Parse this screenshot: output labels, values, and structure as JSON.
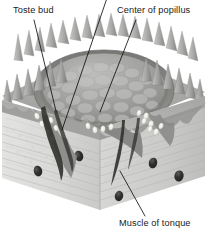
{
  "figure": {
    "width": 208,
    "height": 233,
    "background_color": "#ffffff",
    "style": "grayscale anatomical illustration"
  },
  "labels": [
    {
      "id": "taste-bud",
      "text": "Toste bud",
      "position": {
        "x": 13,
        "y": 6
      },
      "leader_line": {
        "x1": 34,
        "y1": 20,
        "x2": 56,
        "y2": 111
      }
    },
    {
      "id": "center-of-papilla",
      "text": "Center of popillus",
      "position": {
        "x": 117,
        "y": 6
      },
      "leader_line": {
        "x1": 136,
        "y1": 20,
        "x2": 100,
        "y2": 112
      }
    },
    {
      "id": "muscle-of-tongue",
      "text": "Muscle of tonque",
      "position": {
        "x": 119,
        "y": 219
      },
      "leader_line": {
        "x1": 145,
        "y1": 216,
        "x2": 120,
        "y2": 171
      }
    }
  ],
  "unlabeled_leader_line": {
    "id": "trench-pointer",
    "x1": 107,
    "y1": -2,
    "x2": 62,
    "y2": 130
  },
  "colors": {
    "background": "#ffffff",
    "face_left": "#d8d8d6",
    "face_right": "#cfd0cf",
    "face_top_light": "#c6c7c5",
    "epithelium": "#a9aaa8",
    "trench_wall": "#8e8f8d",
    "papilla_dome": "#9b9c9a",
    "spike_light": "#b8b9b7",
    "spike_dark": "#7d7e7c",
    "vessel_dark": "#2d2e2c",
    "taste_bud_light": "#f2f2ef",
    "leader_line": "#111111",
    "label_text": "#1a1a1a"
  },
  "structures": {
    "filiform_papillae": {
      "name": "filiform papillae spikes",
      "count_front_left": 9,
      "count_front_right": 9,
      "count_back_rim": 18
    },
    "circumvallate_papilla": {
      "name": "central circumvallate papilla dome",
      "center": {
        "x": 104,
        "y": 86
      },
      "radius_x": 62,
      "radius_y": 34,
      "bump_rows": 5
    },
    "trench": {
      "name": "circular trench surrounding papilla",
      "description": "groove separating papilla from surrounding epithelium"
    },
    "taste_buds": {
      "name": "taste buds in trench walls",
      "count": 18,
      "description": "small light ovals embedded along both trench walls"
    },
    "nerve_vessel_bundles": {
      "name": "nerve and vessel bundles",
      "count": 3,
      "description": "dark tapering channels descending from papilla base into muscle"
    },
    "vessel_cross_sections": {
      "name": "blood vessel cross sections",
      "count": 5,
      "positions": [
        {
          "x": 38,
          "y": 171
        },
        {
          "x": 79,
          "y": 156
        },
        {
          "x": 119,
          "y": 196
        },
        {
          "x": 153,
          "y": 163
        },
        {
          "x": 179,
          "y": 176
        }
      ]
    },
    "muscle_striations": {
      "name": "muscle fiber striations",
      "description": "diagonal fiber lines across both cut faces"
    }
  }
}
